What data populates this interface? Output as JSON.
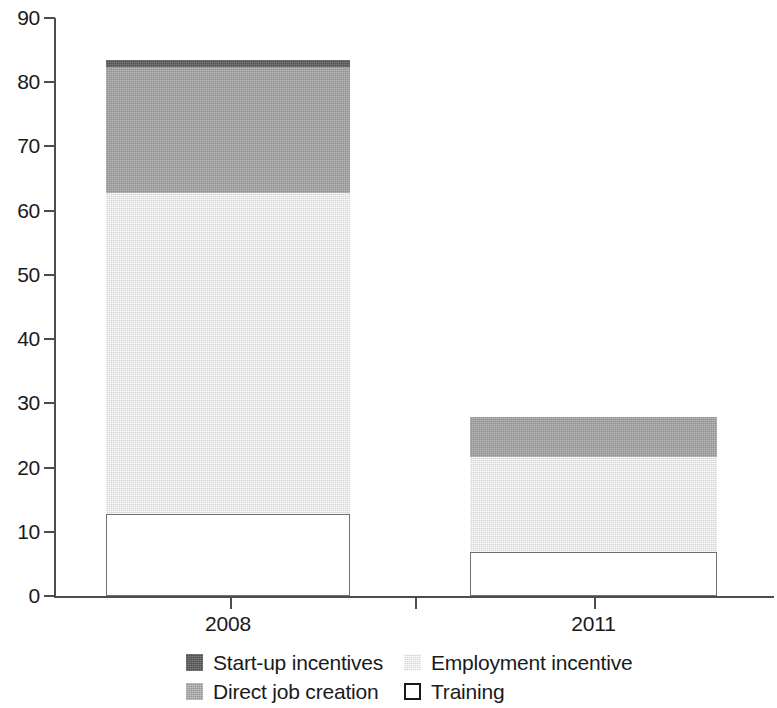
{
  "chart_data": {
    "type": "bar",
    "subtype": "stacked-vertical",
    "title": "",
    "subtitle": "",
    "xlabel": "",
    "ylabel": "",
    "categories": [
      "2008",
      "2011"
    ],
    "ylim": [
      0,
      90
    ],
    "yticks": [
      0,
      10,
      20,
      30,
      40,
      50,
      60,
      70,
      80,
      90
    ],
    "ytick_labels": [
      "0",
      "10",
      "20",
      "30",
      "40",
      "50",
      "60",
      "70",
      "80",
      "90"
    ],
    "grid": false,
    "legend_position": "bottom",
    "stack_order_bottom_to_top": [
      "Training",
      "Employment incentive",
      "Direct job creation",
      "Start-up incentives"
    ],
    "series": [
      {
        "name": "Start-up incentives",
        "values": [
          1.2,
          0.0
        ]
      },
      {
        "name": "Direct job creation",
        "values": [
          19.5,
          6.2
        ]
      },
      {
        "name": "Employment incentive",
        "values": [
          50.0,
          14.8
        ]
      },
      {
        "name": "Training",
        "values": [
          12.8,
          6.8
        ]
      }
    ],
    "totals": [
      83.5,
      27.8
    ],
    "cumulative_tops": {
      "2008": {
        "Training": 12.8,
        "Employment incentive": 62.8,
        "Direct job creation": 82.3,
        "Start-up incentives": 83.5
      },
      "2011": {
        "Training": 6.8,
        "Employment incentive": 21.6,
        "Direct job creation": 27.8,
        "Start-up incentives": 27.8
      }
    },
    "colors": {
      "Start-up incentives": "#5c5c5c",
      "Direct job creation": "#a0a0a0",
      "Employment incentive": "#e6e6e6",
      "Training": "#ffffff",
      "axis": "#4d4d4d",
      "text": "#1a1a1a"
    }
  },
  "legend": {
    "entries": [
      {
        "label": "Start-up incentives",
        "key": "startup",
        "row": 0,
        "col": 0
      },
      {
        "label": "Employment incentive",
        "key": "employment",
        "row": 0,
        "col": 1
      },
      {
        "label": "Direct job creation",
        "key": "direct",
        "row": 1,
        "col": 0
      },
      {
        "label": "Training",
        "key": "training",
        "row": 1,
        "col": 1
      }
    ]
  },
  "axes": {
    "y_tick_labels": [
      "90",
      "80",
      "70",
      "60",
      "50",
      "40",
      "30",
      "20",
      "10",
      "0"
    ],
    "x_tick_labels": [
      "2008",
      "2011"
    ]
  }
}
